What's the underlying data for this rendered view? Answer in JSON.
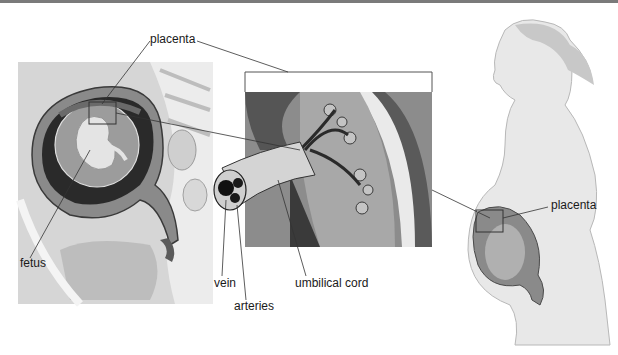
{
  "figure": {
    "panels": [
      {
        "id": "uterus-cross-section",
        "description": "Sagittal section of uterus with fetus and placenta"
      },
      {
        "id": "placenta-detail",
        "description": "Enlarged view of placenta with umbilical cord cross-section"
      },
      {
        "id": "pregnant-woman",
        "description": "Side profile of pregnant woman with uterus inset"
      }
    ]
  },
  "labels": {
    "placenta_top": "placenta",
    "fetus": "fetus",
    "vein": "vein",
    "arteries": "arteries",
    "umbilical_cord": "umbilical cord",
    "placenta_right": "placenta"
  },
  "colors": {
    "topbar": "#7a7a7a",
    "line": "#333333",
    "skin": "#e6e6e6",
    "tissue_dark": "#2a2a2a",
    "tissue_mid": "#8a8a8a",
    "tissue_light": "#c8c8c8"
  }
}
